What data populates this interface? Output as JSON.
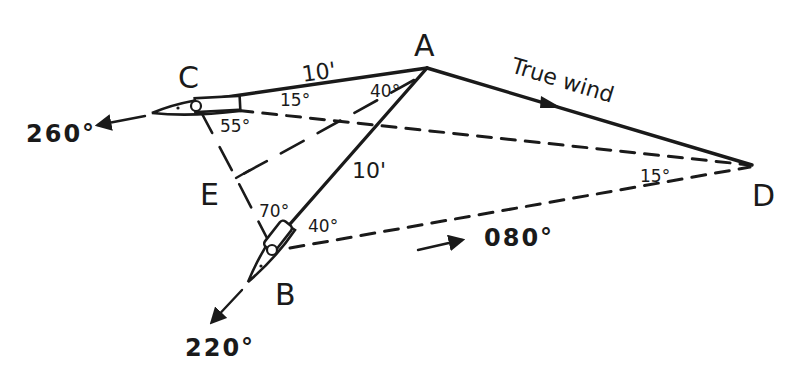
{
  "diagram": {
    "type": "vector triangle (true wind from boat courses)",
    "colors": {
      "ink": "#1a1a1a",
      "background": "#ffffff"
    },
    "points": {
      "A": {
        "label": "A"
      },
      "B": {
        "label": "B"
      },
      "C": {
        "label": "C"
      },
      "D": {
        "label": "D"
      },
      "E": {
        "label": "E"
      }
    },
    "segments": {
      "CA": {
        "length_label": "10'"
      },
      "AB": {
        "length_label": "10'"
      },
      "AD": {
        "label": "True wind"
      }
    },
    "angles": {
      "at_A": "40°",
      "at_C_upper": "15°",
      "at_C_lower": "55°",
      "at_B_upper": "70°",
      "at_B_right": "40°",
      "at_D": "15°"
    },
    "headings": {
      "boat_C": "260°",
      "boat_B": "220°",
      "bottom_arrow": "080°"
    }
  }
}
